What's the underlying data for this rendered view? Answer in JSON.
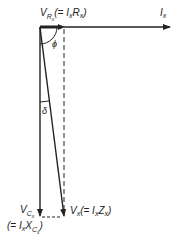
{
  "diagram": {
    "type": "phasor-diagram",
    "labels": {
      "vr_main": "V",
      "vr_sub": "R",
      "vr_subsub": "x",
      "vr_eq": "(= I",
      "vr_eq_sub1": "x",
      "vr_eq_mid": "R",
      "vr_eq_sub2": "x",
      "vr_eq_close": ")",
      "ix_main": "I",
      "ix_sub": "x",
      "phi": "ϕ",
      "delta": "δ",
      "vc_main": "V",
      "vc_sub": "C",
      "vc_subsub": "x",
      "vc_eq": "(= I",
      "vc_eq_sub1": "x",
      "vc_eq_mid": "X",
      "vc_eq_sub2": "C",
      "vc_eq_sub3": "x",
      "vc_eq_close": ")",
      "vx_main": "V",
      "vx_sub": "x",
      "vx_eq": "(= I",
      "vx_eq_sub1": "x",
      "vx_eq_mid": "Z",
      "vx_eq_sub2": "x",
      "vx_eq_close": ")"
    },
    "phasors": [
      {
        "name": "I_x",
        "direction": "horizontal-right"
      },
      {
        "name": "V_Rx",
        "direction": "horizontal-right-short"
      },
      {
        "name": "V_Cx",
        "direction": "vertical-down"
      },
      {
        "name": "V_x",
        "direction": "diagonal-down"
      }
    ],
    "angles": [
      "phi",
      "delta"
    ],
    "color": "#222222"
  }
}
